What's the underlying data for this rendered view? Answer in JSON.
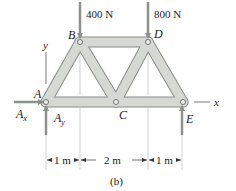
{
  "figure": {
    "caption": "(b)",
    "type": "truss free-body diagram"
  },
  "joints": [
    {
      "id": "A",
      "label": "A",
      "x": 46,
      "y": 102
    },
    {
      "id": "B",
      "label": "B",
      "x": 80,
      "y": 42
    },
    {
      "id": "C",
      "label": "C",
      "x": 116,
      "y": 102
    },
    {
      "id": "D",
      "label": "D",
      "x": 148,
      "y": 42
    },
    {
      "id": "E",
      "label": "E",
      "x": 183,
      "y": 102
    }
  ],
  "members": [
    [
      "A",
      "B"
    ],
    [
      "B",
      "C"
    ],
    [
      "A",
      "C"
    ],
    [
      "B",
      "D"
    ],
    [
      "C",
      "D"
    ],
    [
      "D",
      "E"
    ],
    [
      "C",
      "E"
    ]
  ],
  "loads": [
    {
      "label": "400 N",
      "joint": "B",
      "direction": "down"
    },
    {
      "label": "800 N",
      "joint": "D",
      "direction": "down"
    }
  ],
  "reactions": [
    {
      "label": "A",
      "sub": "x",
      "joint": "A",
      "direction": "right"
    },
    {
      "label": "A",
      "sub": "y",
      "joint": "A",
      "direction": "up"
    },
    {
      "label": "E",
      "sub": "",
      "joint": "E",
      "direction": "up"
    }
  ],
  "axes": {
    "x_label": "x",
    "y_label": "y"
  },
  "dimensions": [
    {
      "label": "1 m",
      "from": "A",
      "to": "B"
    },
    {
      "label": "2 m",
      "from": "B",
      "to": "D"
    },
    {
      "label": "1 m",
      "from": "D",
      "to": "E"
    }
  ],
  "colors": {
    "member_fill": "#d6d8d4",
    "member_stroke": "#8a8c88",
    "arrow": "#8e908c",
    "text": "#222222",
    "guide": "#9a9a9a"
  }
}
